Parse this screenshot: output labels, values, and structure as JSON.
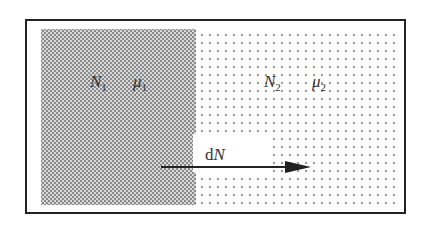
{
  "diagram": {
    "left_region": {
      "particle_number": {
        "symbol": "N",
        "subscript": "1"
      },
      "chemical_potential": {
        "symbol": "μ",
        "subscript": "1"
      },
      "shading": "dense dots (darker)"
    },
    "right_region": {
      "particle_number": {
        "symbol": "N",
        "subscript": "2"
      },
      "chemical_potential": {
        "symbol": "μ",
        "subscript": "2"
      },
      "shading": "sparse dots (lighter)"
    },
    "flow": {
      "label_prefix": "d",
      "label_symbol": "N",
      "direction": "left-to-right"
    }
  }
}
